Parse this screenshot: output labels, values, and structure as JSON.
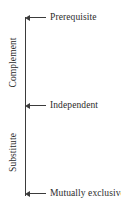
{
  "diagram": {
    "axis": {
      "orientation": "vertical",
      "color": "#3b3b3b",
      "top_y": 17,
      "bottom_y": 196
    },
    "nodes": [
      {
        "id": "prerequisite",
        "label": "Prerequisite",
        "arrow": "left-arrow-icon",
        "position": "top"
      },
      {
        "id": "independent",
        "label": "Independent",
        "arrow": "left-arrow-icon",
        "position": "middle"
      },
      {
        "id": "mutually-exclusive",
        "label": "Mutually exclusive",
        "arrow": "left-arrow-icon",
        "position": "bottom"
      }
    ],
    "ranges": [
      {
        "id": "complement",
        "label": "Complement",
        "spans": "prerequisite-to-independent"
      },
      {
        "id": "substitute",
        "label": "Substitute",
        "spans": "independent-to-mutually-exclusive"
      }
    ],
    "colors": {
      "line": "#3b3b3b",
      "text": "#2b2b2b",
      "background": "#ffffff"
    }
  }
}
